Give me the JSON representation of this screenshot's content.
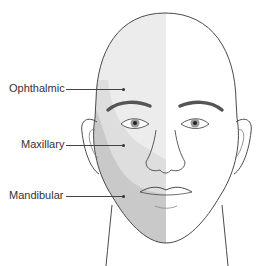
{
  "diagram": {
    "labels": [
      {
        "text": "Ophthalmic",
        "region": "upper face / forehead"
      },
      {
        "text": "Maxillary",
        "region": "mid face / cheek"
      },
      {
        "text": "Mandibular",
        "region": "lower face / jaw"
      }
    ],
    "colors": {
      "ophthalmic": "#ebebeb",
      "maxillary": "#dcdcdc",
      "mandibular": "#c9c9c9",
      "outline": "#4a4a4a",
      "background": "#ffffff"
    }
  }
}
